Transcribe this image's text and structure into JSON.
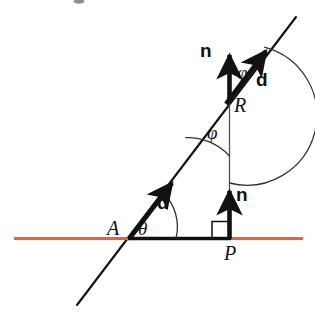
{
  "figure": {
    "background_color": "#ffffff",
    "width": 315,
    "height": 329,
    "colors": {
      "surface_line": "#e8633a",
      "stroke": "#111111",
      "thin_stroke": "#333333"
    },
    "labels": {
      "point_a": "A",
      "point_p": "P",
      "point_r": "R",
      "theta": "θ",
      "phi_upper": "φ",
      "phi_lower": "φ",
      "direction_lower": "d",
      "direction_upper": "d",
      "normal_lower": "n",
      "normal_upper": "n"
    },
    "elements": {
      "surface_line_name": "horizontal-surface-line",
      "ray_line_name": "incident-ray-line",
      "right_angle_name": "right-angle-marker",
      "vertical_drop_name": "vertical-line-r-to-p"
    }
  }
}
